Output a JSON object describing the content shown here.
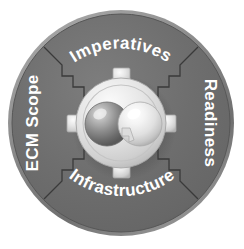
{
  "diagram": {
    "type": "radial-framework-wheel",
    "background_color": "#ffffff",
    "disc": {
      "name": "outer-disc",
      "fill_color": "#6e6e6e",
      "rim_color": "#8d8d8d",
      "center_x": 121,
      "center_y": 123,
      "radius": 113
    },
    "quadrants": [
      {
        "id": "imperatives",
        "label": "Imperatives",
        "position": "top",
        "orientation": "arc-top"
      },
      {
        "id": "readiness",
        "label": "Readiness",
        "position": "right",
        "orientation": "vertical-down"
      },
      {
        "id": "infrastructure",
        "label": "Infrastructure",
        "position": "bottom",
        "orientation": "arc-bottom"
      },
      {
        "id": "ecm-scope",
        "label": "ECM Scope",
        "position": "left",
        "orientation": "vertical-up"
      }
    ],
    "divider": {
      "name": "stepped-puzzle-divider",
      "style": "zigzag-step",
      "stroke_color": "#3a3a3a",
      "count": 4
    },
    "hub": {
      "name": "center-hub",
      "fill_color": "#d8d8d8",
      "highlight_color": "#f2f2f2",
      "edge_color": "#9a9a9a",
      "radius": 44,
      "tab_count": 4,
      "tab_positions": [
        "top",
        "right",
        "bottom",
        "left"
      ]
    },
    "spheres": [
      {
        "id": "sphere-left",
        "label": "",
        "fill_color": "#8f8f8f",
        "highlight_color": "#e6e6e6",
        "shadow_color": "#5a5a5a",
        "center_x": 107,
        "center_y": 124,
        "radius": 22
      },
      {
        "id": "sphere-right",
        "label": "",
        "fill_color": "#ececec",
        "highlight_color": "#ffffff",
        "shadow_color": "#b4b4b4",
        "center_x": 140,
        "center_y": 124,
        "radius": 22
      }
    ],
    "colors": {
      "disc_gray": "#6e6e6e",
      "label_white": "#ffffff",
      "hub_light": "#d8d8d8",
      "divider_dark": "#3a3a3a",
      "background": "#ffffff"
    }
  }
}
